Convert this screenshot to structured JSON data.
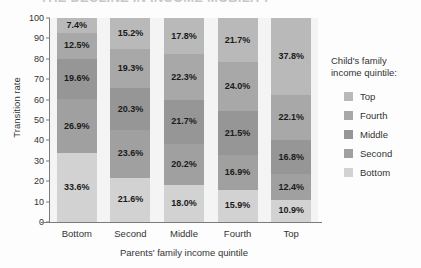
{
  "title_sliver": "THE DECLINE IN INCOME MOBILITY",
  "legend": {
    "title": "Child's family income quintile:",
    "items": [
      {
        "label": "Top",
        "color": "#b9b9b9"
      },
      {
        "label": "Fourth",
        "color": "#a8a8a8"
      },
      {
        "label": "Middle",
        "color": "#969696"
      },
      {
        "label": "Second",
        "color": "#a0a0a0"
      },
      {
        "label": "Bottom",
        "color": "#d2d2d2"
      }
    ]
  },
  "chart_data": {
    "type": "bar",
    "title": "THE DECLINE IN INCOME MOBILITY",
    "xlabel": "Parents' family income quintile",
    "ylabel": "Transition rate",
    "ylim": [
      0,
      100
    ],
    "yticks": [
      0,
      10,
      20,
      30,
      40,
      50,
      60,
      70,
      80,
      90,
      100
    ],
    "grid": false,
    "stacked": true,
    "legend_position": "right",
    "legend_title": "Child's family income quintile:",
    "categories": [
      "Bottom",
      "Second",
      "Middle",
      "Fourth",
      "Top"
    ],
    "series": [
      {
        "name": "Bottom",
        "color": "#d2d2d2",
        "values": [
          33.6,
          21.6,
          18.0,
          15.9,
          10.9
        ],
        "labels": [
          "33.6%",
          "21.6%",
          "18.0%",
          "15.9%",
          "10.9%"
        ]
      },
      {
        "name": "Second",
        "color": "#a0a0a0",
        "values": [
          26.9,
          23.6,
          20.2,
          16.9,
          12.4
        ],
        "labels": [
          "26.9%",
          "23.6%",
          "20.2%",
          "16.9%",
          "12.4%"
        ]
      },
      {
        "name": "Middle",
        "color": "#969696",
        "values": [
          19.6,
          20.3,
          21.7,
          21.5,
          16.8
        ],
        "labels": [
          "19.6%",
          "20.3%",
          "21.7%",
          "21.5%",
          "16.8%"
        ]
      },
      {
        "name": "Fourth",
        "color": "#a8a8a8",
        "values": [
          12.5,
          19.3,
          22.3,
          24.0,
          22.1
        ],
        "labels": [
          "12.5%",
          "19.3%",
          "22.3%",
          "24.0%",
          "22.1%"
        ]
      },
      {
        "name": "Top",
        "color": "#b9b9b9",
        "values": [
          7.4,
          15.2,
          17.8,
          21.7,
          37.8
        ],
        "labels": [
          "7.4%",
          "15.2%",
          "17.8%",
          "21.7%",
          "37.8%"
        ]
      }
    ]
  }
}
